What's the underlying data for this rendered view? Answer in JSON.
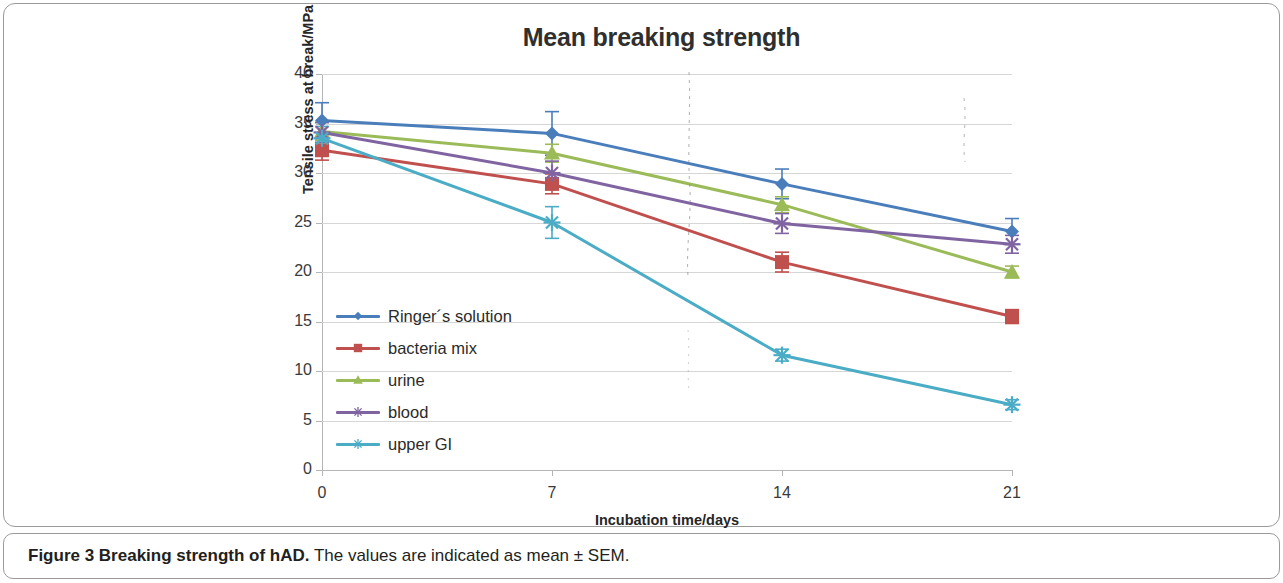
{
  "figure": {
    "caption_bold": "Figure 3 Breaking strength of hAD.",
    "caption_rest": " The values are indicated as mean ± SEM."
  },
  "chart_data": {
    "type": "line",
    "title": "Mean breaking strength",
    "xlabel": "Incubation time/days",
    "ylabel": "Tensile stress at break/MPa",
    "x": [
      0,
      7,
      14,
      21
    ],
    "xtick_labels": [
      "0",
      "7",
      "14",
      "21"
    ],
    "ytick_labels": [
      "0",
      "5",
      "10",
      "15",
      "20",
      "25",
      "30",
      "35",
      "40"
    ],
    "yticks": [
      0,
      5,
      10,
      15,
      20,
      25,
      30,
      35,
      40
    ],
    "ylim": [
      0,
      40
    ],
    "xlim": [
      0,
      21
    ],
    "grid": "horizontal",
    "legend_position": "inside-lower-left",
    "error_bars": "mean ± SEM",
    "series": [
      {
        "name": "Ringer´s solution",
        "color": "#4a7ebb",
        "marker": "diamond",
        "values": [
          35.3,
          34.0,
          28.9,
          24.1
        ],
        "errors": [
          1.8,
          2.2,
          1.5,
          1.3
        ]
      },
      {
        "name": "bacteria mix",
        "color": "#c0504d",
        "marker": "square",
        "values": [
          32.3,
          28.9,
          21.0,
          15.5
        ],
        "errors": [
          1.0,
          1.0,
          1.0,
          0.7
        ]
      },
      {
        "name": "urine",
        "color": "#9bbb59",
        "marker": "triangle",
        "values": [
          34.2,
          32.0,
          26.8,
          20.0
        ],
        "errors": [
          0.9,
          0.9,
          0.8,
          0.6
        ]
      },
      {
        "name": "blood",
        "color": "#8064a2",
        "marker": "star",
        "values": [
          34.1,
          30.0,
          24.9,
          22.8
        ],
        "errors": [
          1.0,
          1.2,
          1.0,
          0.9
        ]
      },
      {
        "name": "upper GI",
        "color": "#4bacc6",
        "marker": "star",
        "values": [
          33.5,
          25.0,
          11.6,
          6.6
        ],
        "errors": [
          1.2,
          1.6,
          0.6,
          0.5
        ]
      }
    ]
  }
}
